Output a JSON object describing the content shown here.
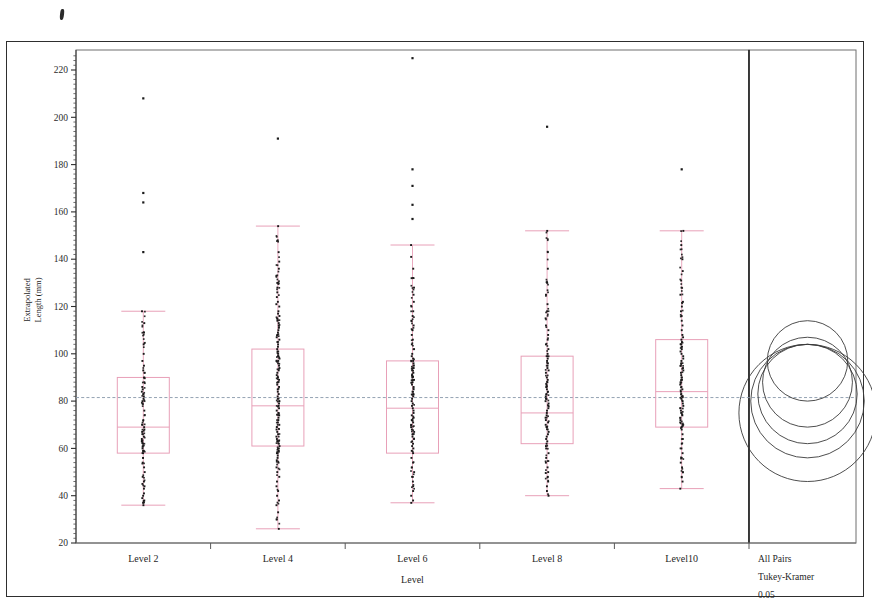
{
  "chart_data": {
    "type": "box",
    "title": "",
    "xlabel": "Level",
    "ylabel": "Extrapolated Length (mm)",
    "ylim": [
      20,
      228
    ],
    "yticks": [
      20,
      40,
      60,
      80,
      100,
      120,
      140,
      160,
      180,
      200,
      220
    ],
    "ytick_labels": [
      "20",
      "40",
      "60",
      "80",
      "100",
      "120",
      "140",
      "160",
      "180",
      "200",
      "220"
    ],
    "categories": [
      "Level 2",
      "Level 4",
      "Level 6",
      "Level 8",
      "Level10"
    ],
    "grand_mean": 81.5,
    "grid": false,
    "legend_position": "right-panel",
    "box_color": "#e8a0b8",
    "point_color": "#1a1a1a",
    "grand_mean_color": "#8899aa",
    "boxes": [
      {
        "category": "Level 2",
        "whisker_low": 36,
        "q1": 58,
        "median": 69,
        "q3": 90,
        "whisker_high": 118,
        "outliers": [
          208,
          168,
          164,
          143
        ],
        "points": [
          118,
          113,
          109,
          104,
          100,
          97,
          95,
          93,
          92,
          90,
          88,
          86,
          85,
          84,
          83,
          82,
          81,
          80,
          79,
          76,
          74,
          72,
          70,
          69,
          68,
          67,
          66,
          65,
          64,
          63,
          62,
          61,
          60,
          59,
          58,
          56,
          54,
          52,
          50,
          48,
          46,
          45,
          44,
          43,
          41,
          40,
          39,
          38,
          37,
          36
        ]
      },
      {
        "category": "Level 4",
        "whisker_low": 26,
        "q1": 61,
        "median": 78,
        "q3": 102,
        "whisker_high": 154,
        "outliers": [
          191
        ],
        "points": [
          154,
          148,
          143,
          139,
          136,
          133,
          130,
          128,
          126,
          124,
          122,
          121,
          120,
          118,
          117,
          116,
          115,
          114,
          113,
          112,
          111,
          110,
          109,
          108,
          107,
          106,
          105,
          104,
          103,
          102,
          101,
          100,
          99,
          98,
          97,
          96,
          95,
          94,
          93,
          92,
          91,
          90,
          89,
          88,
          87,
          86,
          85,
          84,
          83,
          82,
          81,
          80,
          79,
          78,
          77,
          76,
          75,
          74,
          73,
          72,
          71,
          70,
          69,
          68,
          67,
          66,
          65,
          64,
          63,
          62,
          61,
          60,
          59,
          58,
          57,
          56,
          55,
          54,
          52,
          50,
          48,
          46,
          44,
          42,
          40,
          38,
          36,
          33,
          30,
          26
        ]
      },
      {
        "category": "Level 6",
        "whisker_low": 37,
        "q1": 58,
        "median": 77,
        "q3": 97,
        "whisker_high": 146,
        "outliers": [
          225,
          178,
          171,
          163,
          157
        ],
        "points": [
          146,
          141,
          136,
          132,
          128,
          125,
          122,
          120,
          118,
          116,
          114,
          112,
          110,
          108,
          106,
          104,
          102,
          100,
          99,
          98,
          97,
          96,
          95,
          94,
          93,
          92,
          91,
          90,
          89,
          88,
          87,
          86,
          85,
          84,
          83,
          82,
          81,
          80,
          79,
          78,
          77,
          76,
          75,
          74,
          73,
          72,
          71,
          70,
          69,
          68,
          67,
          66,
          65,
          64,
          63,
          62,
          61,
          60,
          59,
          58,
          56,
          54,
          52,
          50,
          48,
          46,
          44,
          42,
          40,
          38,
          37
        ]
      },
      {
        "category": "Level 8",
        "whisker_low": 40,
        "q1": 62,
        "median": 75,
        "q3": 99,
        "whisker_high": 152,
        "outliers": [
          196
        ],
        "points": [
          152,
          143,
          136,
          130,
          125,
          121,
          118,
          115,
          112,
          110,
          108,
          106,
          104,
          102,
          100,
          99,
          98,
          97,
          96,
          95,
          94,
          93,
          92,
          90,
          89,
          88,
          87,
          86,
          85,
          84,
          83,
          82,
          81,
          80,
          79,
          78,
          77,
          76,
          75,
          74,
          73,
          72,
          71,
          70,
          69,
          68,
          67,
          66,
          65,
          64,
          63,
          62,
          61,
          60,
          58,
          56,
          54,
          52,
          50,
          48,
          46,
          44,
          42,
          40
        ]
      },
      {
        "category": "Level10",
        "whisker_low": 43,
        "q1": 69,
        "median": 84,
        "q3": 106,
        "whisker_high": 152,
        "outliers": [
          178
        ],
        "points": [
          152,
          146,
          140,
          135,
          131,
          128,
          125,
          122,
          120,
          118,
          116,
          114,
          112,
          110,
          108,
          107,
          106,
          105,
          104,
          103,
          102,
          101,
          100,
          99,
          98,
          97,
          96,
          95,
          94,
          93,
          92,
          91,
          90,
          89,
          88,
          87,
          86,
          85,
          84,
          83,
          82,
          81,
          80,
          79,
          78,
          77,
          76,
          75,
          74,
          73,
          72,
          71,
          70,
          69,
          68,
          66,
          64,
          62,
          60,
          58,
          56,
          54,
          52,
          50,
          48,
          46,
          43
        ]
      }
    ]
  },
  "comparison_panel": {
    "line1": "All Pairs",
    "line2": "Tukey-Kramer",
    "line3": "0.05",
    "circles": [
      {
        "cy_value": 97,
        "r_value": 17
      },
      {
        "cy_value": 88,
        "r_value": 19
      },
      {
        "cy_value": 83,
        "r_value": 21
      },
      {
        "cy_value": 80,
        "r_value": 24
      },
      {
        "cy_value": 75,
        "r_value": 29
      }
    ]
  }
}
